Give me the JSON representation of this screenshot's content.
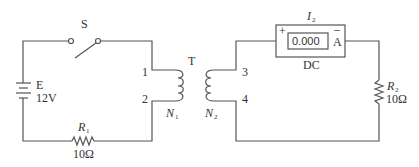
{
  "diagram": {
    "type": "circuit",
    "switch": {
      "label": "S"
    },
    "battery": {
      "label": "E",
      "value": "12V"
    },
    "resistor1": {
      "label": "R",
      "sub": "1",
      "value": "10Ω"
    },
    "transformer": {
      "label": "T",
      "primary": {
        "label": "N",
        "sub": "1",
        "terminals": [
          "1",
          "2"
        ]
      },
      "secondary": {
        "label": "N",
        "sub": "2",
        "terminals": [
          "3",
          "4"
        ]
      }
    },
    "ammeter": {
      "label": "I",
      "sub": "2",
      "reading": "0.000",
      "unit": "A",
      "plus": "+",
      "minus": "–",
      "mode": "DC"
    },
    "resistor2": {
      "label": "R",
      "sub": "2",
      "value": "10Ω"
    },
    "colors": {
      "line": "#555555",
      "text": "#333333"
    }
  }
}
